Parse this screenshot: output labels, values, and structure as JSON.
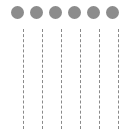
{
  "diagram": {
    "type": "lifelines",
    "node_color": "#8c8c8c",
    "line_color": "#8a8a8a",
    "lanes": [
      {
        "node_x": 11,
        "line_x": 23
      },
      {
        "node_x": 30,
        "line_x": 42
      },
      {
        "node_x": 49,
        "line_x": 61
      },
      {
        "node_x": 68,
        "line_x": 80
      },
      {
        "node_x": 87,
        "line_x": 99
      },
      {
        "node_x": 106,
        "line_x": 118
      }
    ]
  }
}
